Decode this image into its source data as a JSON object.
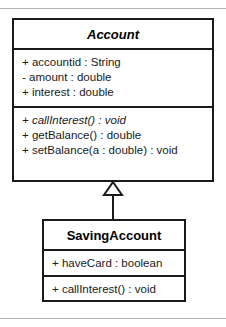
{
  "diagram": {
    "type": "uml-class-diagram",
    "background_color": "#ffffff",
    "line_color": "#1a1a1a",
    "rule_color": "#b0b0b0"
  },
  "classes": [
    {
      "id": "account",
      "name": "Account",
      "is_abstract": true,
      "attributes": [
        "+ accountid : String",
        "- amount : double",
        "+ interest : double"
      ],
      "methods": [
        "+ callInterest() : void",
        "+ getBalance() : double",
        "+ setBalance(a : double) : void"
      ]
    },
    {
      "id": "savingaccount",
      "name": "SavingAccount",
      "is_abstract": false,
      "attributes": [
        "+ haveCard : boolean"
      ],
      "methods": [
        "+ callInterest() : void"
      ]
    }
  ],
  "relationships": [
    {
      "kind": "generalization",
      "from": "SavingAccount",
      "to": "Account",
      "arrow": "hollow-triangle"
    }
  ]
}
